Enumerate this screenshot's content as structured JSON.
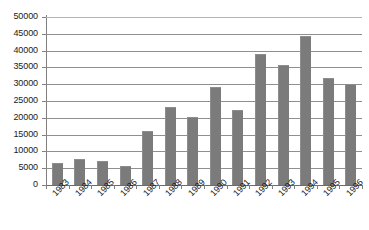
{
  "chart_data": {
    "type": "bar",
    "title": "",
    "subtitle": "",
    "xlabel": "",
    "ylabel": "",
    "categories": [
      "1983",
      "1984",
      "1985",
      "1986",
      "1987",
      "1988",
      "1989",
      "1990",
      "1991",
      "1992",
      "1993",
      "1994",
      "1995",
      "1996"
    ],
    "values": [
      6500,
      7700,
      7200,
      5700,
      16200,
      23100,
      20100,
      29300,
      22300,
      38900,
      35700,
      44200,
      31700,
      30200
    ],
    "series": [
      {
        "name": "",
        "values": [
          6500,
          7700,
          7200,
          5700,
          16200,
          23100,
          20100,
          29300,
          22300,
          38900,
          35700,
          44200,
          31700,
          30200
        ]
      }
    ],
    "ylim": [
      0,
      50000
    ],
    "ytick_step": 5000,
    "ytick_labels": [
      "0",
      "5000",
      "10000",
      "15000",
      "20000",
      "25000",
      "30000",
      "35000",
      "40000",
      "45000",
      "50000"
    ],
    "ytick_values": [
      0,
      5000,
      10000,
      15000,
      20000,
      25000,
      30000,
      35000,
      40000,
      45000,
      50000
    ],
    "grid": true,
    "grid_orientation": "horizontal",
    "legend": false,
    "legend_position": "none",
    "bar_color": "#7b7b7b",
    "gridline_color": "#8f8f8f",
    "axis_color": "#808080",
    "background_color": "#ffffff",
    "xtick_label_rotation": -45
  }
}
